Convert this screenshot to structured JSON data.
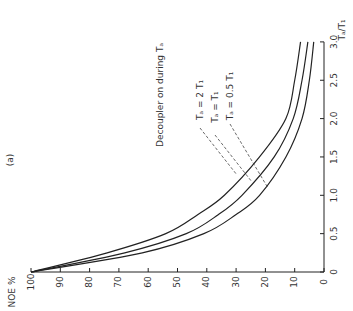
{
  "chart_data": {
    "type": "line",
    "orientation": "rotated-90-ccw",
    "panel_label": "(a)",
    "title": "",
    "xlabel": "T_a/T_1",
    "ylabel": "NOE %",
    "xlim": [
      0,
      3.0
    ],
    "ylim": [
      0,
      100
    ],
    "x_ticks": [
      "0",
      "0.5",
      "1.0",
      "1.5",
      "2.0",
      "2.5",
      "3.0"
    ],
    "x_tick_values": [
      0,
      0.5,
      1.0,
      1.5,
      2.0,
      2.5,
      3.0
    ],
    "y_ticks": [
      "0",
      "10",
      "20",
      "30",
      "40",
      "50",
      "60",
      "70",
      "80",
      "90",
      "100"
    ],
    "y_tick_values": [
      0,
      10,
      20,
      30,
      40,
      50,
      60,
      70,
      80,
      90,
      100
    ],
    "grid": false,
    "annotation": "Decoupler on during T_a",
    "x": [
      0,
      0.25,
      0.5,
      0.75,
      1.0,
      1.5,
      2.0,
      2.5,
      3.0
    ],
    "series": [
      {
        "name": "T_a = 2 T_1",
        "label": "Ta = 2 T1",
        "values": [
          100,
          74,
          54,
          43,
          34,
          22,
          13,
          10,
          8
        ]
      },
      {
        "name": "T_a = T_1",
        "label": "Ta = T1",
        "values": [
          100,
          68,
          47,
          36,
          28,
          17,
          10.5,
          7.5,
          5.5
        ]
      },
      {
        "name": "T_a = 0.5 T_1",
        "label": "Ta = 0.5 T1",
        "values": [
          100,
          62,
          41,
          30,
          22,
          13,
          7.5,
          5,
          3.5
        ]
      }
    ]
  }
}
